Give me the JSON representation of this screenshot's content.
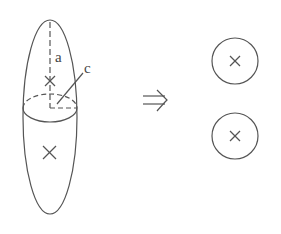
{
  "diagram": {
    "labels": {
      "a": "a",
      "c": "c"
    },
    "arrow": "implies-arrow",
    "left_figure": "prolate-ellipsoid-with-two-centers",
    "right_figure": "two-circles-with-centers",
    "colors": {
      "stroke": "#555555",
      "background": "#ffffff"
    }
  }
}
